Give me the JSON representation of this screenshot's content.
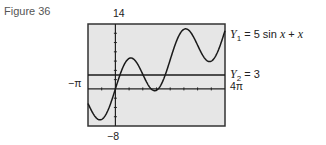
{
  "figure": {
    "label": "Figure 36"
  },
  "window": {
    "ymax_label": "14",
    "ymin_label": "−8",
    "xmin_label": "−π",
    "xmax_label": "4π"
  },
  "equations": {
    "y1": {
      "name": "Y",
      "sub": "1",
      "rhs": "= 5 sin ",
      "var1": "x",
      "plus": " + ",
      "var2": "x"
    },
    "y2": {
      "name": "Y",
      "sub": "2",
      "rhs": "= 3"
    }
  },
  "colors": {
    "screen_bg": "#e6e6e6",
    "frame": "#333333",
    "curve": "#1a1a1a"
  },
  "chart_data": {
    "type": "line",
    "title": "Figure 36",
    "xlabel": "",
    "ylabel": "",
    "xlim": [
      "-π",
      "4π"
    ],
    "ylim": [
      -8,
      14
    ],
    "grid": false,
    "x_tick_spacing": "π/2",
    "y_tick_spacing": 2,
    "series": [
      {
        "name": "Y1 = 5 sin x + x",
        "function": "5*sin(x)+x",
        "x": [
          -3.14,
          -2.36,
          -1.57,
          -0.79,
          0,
          0.79,
          1.57,
          2.36,
          3.14,
          3.93,
          4.71,
          5.5,
          6.28,
          7.07,
          7.85,
          8.64,
          9.42,
          10.21,
          10.99,
          11.78,
          12.57
        ],
        "values": [
          -3.14,
          -5.89,
          -6.57,
          -4.33,
          0,
          4.33,
          6.57,
          5.89,
          3.14,
          0.39,
          -0.29,
          1.96,
          6.28,
          10.61,
          12.85,
          12.17,
          9.42,
          6.68,
          5.99,
          8.24,
          12.57
        ]
      },
      {
        "name": "Y2 = 3",
        "function": "3",
        "x": [
          -3.14,
          12.57
        ],
        "values": [
          3,
          3
        ]
      }
    ],
    "annotations": [
      "Y1 = 5 sin x + x",
      "Y2 = 3",
      "14",
      "-8",
      "-π",
      "4π"
    ],
    "legend_position": "right"
  }
}
